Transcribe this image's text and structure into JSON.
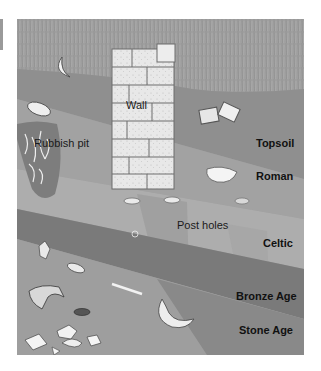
{
  "diagram": {
    "labels": {
      "wall": "Wall",
      "rubbish_pit": "Rubbish pit",
      "post_holes": "Post holes"
    },
    "layers": [
      {
        "name": "Topsoil",
        "color": "#8f8f8f"
      },
      {
        "name": "Roman",
        "color": "#a2a2a2"
      },
      {
        "name": "Celtic",
        "color": "#acacac"
      },
      {
        "name": "Bronze Age",
        "color": "#7a7a7a"
      },
      {
        "name": "Stone Age",
        "color": "#9e9e9e"
      }
    ],
    "grass_color": "#9a9a9a"
  }
}
